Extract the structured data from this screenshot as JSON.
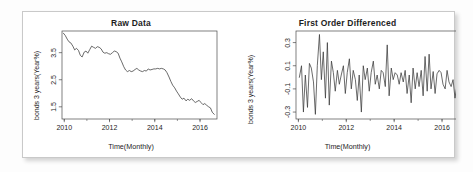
{
  "figure": {
    "panels": [
      {
        "id": "raw",
        "title": "Raw Data",
        "xlabel": "Time(Monthly)",
        "ylabel": "bonds 3 years(Year%)",
        "xticks": [
          "2010",
          "2012",
          "2014",
          "2016"
        ],
        "yticks": [
          "3.5",
          "2.5",
          "1.5"
        ]
      },
      {
        "id": "diff",
        "title": "First Order Differenced",
        "xlabel": "Time(Monthly)",
        "ylabel": "bonds 3 years(Year%)",
        "xticks": [
          "2010",
          "2012",
          "2014",
          "2016"
        ],
        "yticks": [
          "0.3",
          "0.1",
          "-0.1",
          "-0.3"
        ]
      }
    ]
  },
  "chart_data": [
    {
      "type": "line",
      "title": "Raw Data",
      "xlabel": "Time(Monthly)",
      "ylabel": "bonds 3 years(Year%)",
      "grid": false,
      "legend": null,
      "xlim": [
        2009.9,
        2016.75
      ],
      "ylim": [
        1.05,
        4.3
      ],
      "xticks": [
        2010,
        2012,
        2014,
        2016
      ],
      "yticks": [
        3.5,
        2.5,
        1.5
      ],
      "x": [
        2009.96,
        2010.04,
        2010.13,
        2010.21,
        2010.29,
        2010.38,
        2010.46,
        2010.54,
        2010.63,
        2010.71,
        2010.79,
        2010.88,
        2010.96,
        2011.04,
        2011.13,
        2011.21,
        2011.29,
        2011.38,
        2011.46,
        2011.54,
        2011.63,
        2011.71,
        2011.79,
        2011.88,
        2011.96,
        2012.04,
        2012.13,
        2012.21,
        2012.29,
        2012.38,
        2012.46,
        2012.54,
        2012.63,
        2012.71,
        2012.79,
        2012.88,
        2012.96,
        2013.04,
        2013.13,
        2013.21,
        2013.29,
        2013.38,
        2013.46,
        2013.54,
        2013.63,
        2013.71,
        2013.79,
        2013.88,
        2013.96,
        2014.04,
        2014.13,
        2014.21,
        2014.29,
        2014.38,
        2014.46,
        2014.54,
        2014.63,
        2014.71,
        2014.79,
        2014.88,
        2014.96,
        2015.04,
        2015.13,
        2015.21,
        2015.29,
        2015.38,
        2015.46,
        2015.54,
        2015.63,
        2015.71,
        2015.79,
        2015.88,
        2015.96,
        2016.04,
        2016.13,
        2016.21,
        2016.29,
        2016.38,
        2016.46,
        2016.54,
        2016.63
      ],
      "values": [
        4.22,
        4.14,
        4.0,
        3.9,
        3.86,
        3.74,
        3.6,
        3.66,
        3.58,
        3.4,
        3.34,
        3.52,
        3.56,
        3.48,
        3.62,
        3.74,
        3.7,
        3.66,
        3.72,
        3.7,
        3.64,
        3.52,
        3.48,
        3.5,
        3.46,
        3.44,
        3.5,
        3.56,
        3.54,
        3.48,
        3.3,
        3.16,
        2.98,
        2.86,
        2.8,
        2.84,
        2.8,
        2.82,
        2.88,
        2.92,
        2.86,
        2.82,
        2.8,
        2.84,
        2.82,
        2.9,
        2.86,
        2.88,
        2.9,
        2.9,
        2.92,
        2.9,
        2.92,
        2.9,
        2.86,
        2.76,
        2.6,
        2.44,
        2.3,
        2.2,
        2.08,
        1.98,
        1.86,
        1.78,
        1.82,
        1.72,
        1.78,
        1.74,
        1.8,
        1.72,
        1.66,
        1.7,
        1.74,
        1.66,
        1.58,
        1.62,
        1.56,
        1.5,
        1.46,
        1.3,
        1.22
      ]
    },
    {
      "type": "line",
      "title": "First Order Differenced",
      "xlabel": "Time(Monthly)",
      "ylabel": "bonds 3 years(Year%)",
      "grid": false,
      "legend": null,
      "xlim": [
        2009.9,
        2016.75
      ],
      "ylim": [
        -0.36,
        0.4
      ],
      "xticks": [
        2010,
        2012,
        2014,
        2016
      ],
      "yticks": [
        0.3,
        0.1,
        -0.1,
        -0.3
      ],
      "x": [
        2010.04,
        2010.13,
        2010.21,
        2010.29,
        2010.38,
        2010.46,
        2010.54,
        2010.63,
        2010.71,
        2010.79,
        2010.88,
        2010.96,
        2011.04,
        2011.13,
        2011.21,
        2011.29,
        2011.38,
        2011.46,
        2011.54,
        2011.63,
        2011.71,
        2011.79,
        2011.88,
        2011.96,
        2012.04,
        2012.13,
        2012.21,
        2012.29,
        2012.38,
        2012.46,
        2012.54,
        2012.63,
        2012.71,
        2012.79,
        2012.88,
        2012.96,
        2013.04,
        2013.13,
        2013.21,
        2013.29,
        2013.38,
        2013.46,
        2013.54,
        2013.63,
        2013.71,
        2013.79,
        2013.88,
        2013.96,
        2014.04,
        2014.13,
        2014.21,
        2014.29,
        2014.38,
        2014.46,
        2014.54,
        2014.63,
        2014.71,
        2014.79,
        2014.88,
        2014.96,
        2015.04,
        2015.13,
        2015.21,
        2015.29,
        2015.38,
        2015.46,
        2015.54,
        2015.63,
        2015.71,
        2015.79,
        2015.88,
        2015.96,
        2016.04,
        2016.13,
        2016.21,
        2016.29,
        2016.38,
        2016.46,
        2016.54,
        2016.63
      ],
      "values": [
        -0.08,
        -0.14,
        -0.1,
        -0.04,
        -0.12,
        -0.14,
        0.06,
        -0.08,
        -0.18,
        -0.06,
        0.18,
        0.04,
        -0.08,
        0.14,
        0.12,
        -0.04,
        -0.04,
        0.06,
        -0.02,
        -0.06,
        -0.12,
        -0.04,
        0.02,
        -0.04,
        -0.02,
        0.06,
        0.06,
        -0.02,
        -0.06,
        -0.18,
        -0.14,
        -0.18,
        -0.12,
        -0.06,
        0.04,
        -0.04,
        0.02,
        0.06,
        0.04,
        -0.06,
        -0.04,
        -0.02,
        0.04,
        -0.02,
        0.08,
        -0.04,
        0.02,
        0.02,
        0.0,
        0.02,
        -0.02,
        0.02,
        -0.02,
        -0.04,
        -0.1,
        -0.16,
        -0.16,
        -0.14,
        -0.1,
        -0.12,
        -0.1,
        -0.12,
        -0.08,
        0.04,
        -0.1,
        0.06,
        -0.04,
        0.06,
        -0.08,
        -0.06,
        0.04,
        0.04,
        -0.08,
        -0.08,
        0.04,
        -0.06,
        -0.06,
        -0.04,
        -0.16,
        -0.08
      ],
      "note": "plotted series oscillates about zero with spikes up to ~0.37 and down to ~-0.33"
    }
  ],
  "style": {
    "line_color": "#3a3a3a",
    "axis_color": "#4a4a4a",
    "text_color": "#1d1d1d",
    "frame_border": "#c9c9c9",
    "background": "#ffffff"
  }
}
